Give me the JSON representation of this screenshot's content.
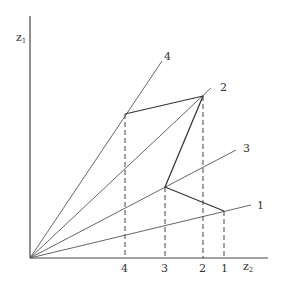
{
  "axes": {
    "y_label": "z",
    "y_sub": "1",
    "x_label": "z",
    "x_sub": "2"
  },
  "rays": [
    {
      "label": "1"
    },
    {
      "label": "2"
    },
    {
      "label": "3"
    },
    {
      "label": "4"
    }
  ],
  "ticks": [
    "4",
    "3",
    "2",
    "1"
  ]
}
